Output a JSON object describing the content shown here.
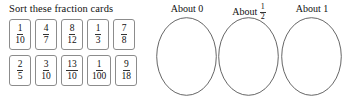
{
  "worksheet": {
    "sort_task": {
      "title": "Sort these fraction cards",
      "cards": [
        [
          {
            "name": "card-1-10",
            "numerator": "1",
            "denominator": "10"
          },
          {
            "name": "card-4-7",
            "numerator": "4",
            "denominator": "7"
          },
          {
            "name": "card-8-12",
            "numerator": "8",
            "denominator": "12"
          },
          {
            "name": "card-1-3",
            "numerator": "1",
            "denominator": "3"
          },
          {
            "name": "card-7-8",
            "numerator": "7",
            "denominator": "8"
          }
        ],
        [
          {
            "name": "card-2-5",
            "numerator": "2",
            "denominator": "5"
          },
          {
            "name": "card-3-10",
            "numerator": "3",
            "denominator": "10"
          },
          {
            "name": "card-13-10",
            "numerator": "13",
            "denominator": "10"
          },
          {
            "name": "card-1-100",
            "numerator": "1",
            "denominator": "100"
          },
          {
            "name": "card-9-18",
            "numerator": "9",
            "denominator": "18"
          }
        ]
      ]
    },
    "targets": [
      {
        "name": "target-about-0",
        "prefix": "About",
        "value": "0",
        "value_is_fraction": false,
        "numerator": "",
        "denominator": ""
      },
      {
        "name": "target-about-half",
        "prefix": "About",
        "value": "",
        "value_is_fraction": true,
        "numerator": "1",
        "denominator": "2"
      },
      {
        "name": "target-about-1",
        "prefix": "About",
        "value": "1",
        "value_is_fraction": false,
        "numerator": "",
        "denominator": ""
      }
    ]
  },
  "colors": {
    "page_background": "#ffffff",
    "text": "#111111",
    "card_border": "#8c8c8c",
    "fraction_bar": "#333333",
    "oval_stroke": "#555555"
  }
}
